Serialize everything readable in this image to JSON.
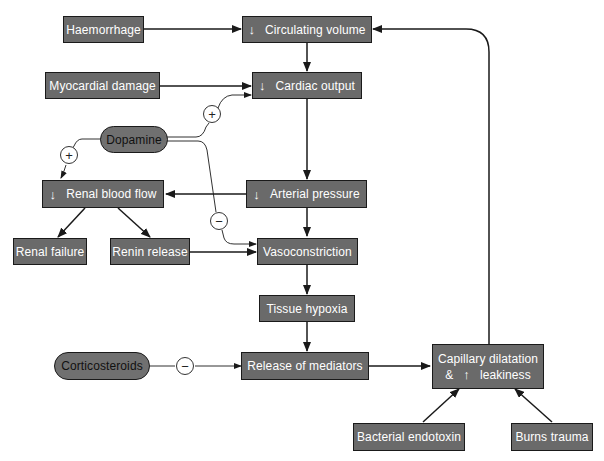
{
  "nodes": {
    "haemorrhage": "Haemorrhage",
    "circulating_volume": "Circulating volume",
    "myocardial_damage": "Myocardial damage",
    "cardiac_output": "Cardiac output",
    "dopamine": "Dopamine",
    "renal_blood_flow": "Renal blood flow",
    "arterial_pressure": "Arterial pressure",
    "renal_failure": "Renal failure",
    "renin_release": "Renin release",
    "vasoconstriction": "Vasoconstriction",
    "tissue_hypoxia": "Tissue hypoxia",
    "corticosteroids": "Corticosteroids",
    "release_of_mediators": "Release of mediators",
    "capillary_line1": "Capillary dilatation",
    "capillary_amp": "&",
    "capillary_line2": "leakiness",
    "bacterial_endotoxin": "Bacterial endotoxin",
    "burns_trauma": "Burns trauma"
  },
  "symbols": {
    "decrease": "↓",
    "increase": "↑",
    "plus": "+",
    "minus": "−"
  },
  "colors": {
    "box_fill": "#6a6a6a",
    "box_text": "#ffffff",
    "line": "#1a1a1a"
  }
}
